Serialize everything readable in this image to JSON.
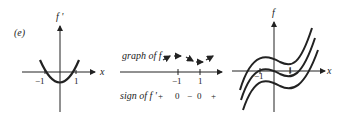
{
  "label": "(e)",
  "panel1": {
    "ylabel": "f '",
    "xlabel": "x",
    "ticks": [
      "−1",
      "1"
    ]
  },
  "panel2": {
    "graph_label": "graph of f",
    "ticks": [
      "−1",
      "1"
    ],
    "sign_label": "sign of f '",
    "signs": [
      "+",
      "0",
      "−",
      "0",
      "+"
    ]
  },
  "panel3": {
    "ylabel": "f",
    "xlabel": "x",
    "ticks": [
      "−1",
      "1"
    ]
  }
}
